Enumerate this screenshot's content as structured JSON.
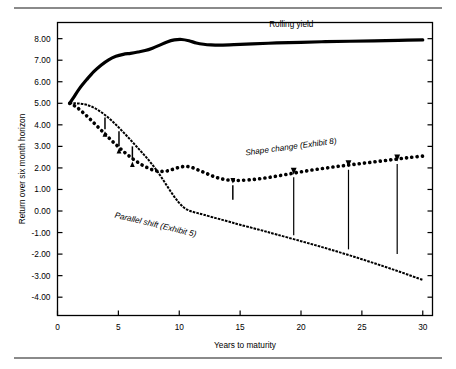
{
  "figure": {
    "background_color": "#ffffff",
    "rule_color": "#8a8a8a",
    "has_top_rule": true,
    "has_bottom_rule": true
  },
  "chart_data": {
    "type": "line",
    "title": "",
    "subtitle": "",
    "xlabel": "Years to maturity",
    "ylabel": "Return over six month horizon",
    "xlim": [
      0,
      30.8
    ],
    "ylim": [
      -4.85,
      8.75
    ],
    "grid": false,
    "legend_position": "inline-annotations",
    "xticks": [
      0,
      5,
      10,
      15,
      20,
      25,
      30
    ],
    "xtick_labels": [
      "0",
      "5",
      "10",
      "15",
      "20",
      "25",
      "30"
    ],
    "yticks": [
      8,
      7,
      6,
      5,
      4,
      3,
      2,
      1,
      0,
      -1,
      -2,
      -3,
      -4
    ],
    "ytick_labels": [
      "8.00",
      "7.00",
      "6.00",
      "5.00",
      "4.00",
      "3.00",
      "2.00",
      "1.00",
      "0.00",
      "-1.00",
      "-2.00",
      "-3.00",
      "-4.00"
    ],
    "series": [
      {
        "name": "Rolling yield",
        "style": "solid-thick",
        "color": "#000000",
        "label": "Rolling yield",
        "label_x": 19.2,
        "label_y": 8.55,
        "label_rotation": 0,
        "x": [
          1.0,
          1.3,
          1.8,
          2.4,
          3.0,
          3.6,
          4.2,
          4.8,
          5.4,
          6.0,
          6.6,
          7.2,
          7.8,
          8.4,
          9.0,
          9.6,
          10.2,
          10.8,
          11.4,
          12.0,
          12.6,
          13.4,
          14.5,
          16.0,
          18.0,
          20.0,
          22.0,
          24.0,
          26.0,
          28.0,
          30.0
        ],
        "y": [
          5.0,
          5.25,
          5.68,
          6.1,
          6.48,
          6.78,
          7.02,
          7.18,
          7.27,
          7.32,
          7.38,
          7.45,
          7.56,
          7.7,
          7.85,
          7.94,
          7.96,
          7.9,
          7.8,
          7.74,
          7.71,
          7.7,
          7.72,
          7.76,
          7.8,
          7.83,
          7.86,
          7.88,
          7.9,
          7.92,
          7.94
        ]
      },
      {
        "name": "Parallel shift (Exhibit 5)",
        "style": "dashed-fine",
        "color": "#000000",
        "label": "Parallel shift (Exhibit 5)",
        "label_x": 8.0,
        "label_y": -0.75,
        "label_rotation": 13.5,
        "x": [
          1.0,
          1.4,
          1.9,
          2.4,
          2.9,
          3.4,
          3.9,
          4.4,
          4.9,
          5.4,
          5.9,
          6.4,
          6.9,
          7.4,
          7.9,
          8.4,
          8.9,
          9.4,
          9.9,
          10.4,
          10.9,
          11.4,
          12.0,
          13.0,
          14.0,
          15.0,
          16.5,
          18.0,
          20.0,
          22.0,
          24.0,
          26.0,
          28.0,
          30.0
        ],
        "y": [
          5.0,
          5.0,
          4.98,
          4.93,
          4.82,
          4.66,
          4.46,
          4.22,
          3.95,
          3.66,
          3.36,
          3.05,
          2.74,
          2.42,
          2.07,
          1.68,
          1.25,
          0.82,
          0.44,
          0.15,
          0.0,
          -0.08,
          -0.17,
          -0.33,
          -0.48,
          -0.64,
          -0.86,
          -1.09,
          -1.4,
          -1.72,
          -2.06,
          -2.42,
          -2.8,
          -3.2
        ]
      },
      {
        "name": "Shape change (Exhibit 8)",
        "style": "dotted-heavy",
        "color": "#000000",
        "label": "Shape change (Exhibit 8)",
        "label_x": 19.2,
        "label_y": 2.86,
        "label_rotation": -7.5,
        "x": [
          1.0,
          1.5,
          2.0,
          2.5,
          3.0,
          3.5,
          4.0,
          4.5,
          5.0,
          5.5,
          6.0,
          6.5,
          7.0,
          7.5,
          8.0,
          8.5,
          9.0,
          9.5,
          10.0,
          10.5,
          11.0,
          11.5,
          12.0,
          12.5,
          13.0,
          13.5,
          14.0,
          14.5,
          15.0,
          16.0,
          17.0,
          18.0,
          19.0,
          20.0,
          21.0,
          22.0,
          23.0,
          24.0,
          25.0,
          26.0,
          27.0,
          28.0,
          29.0,
          30.0
        ],
        "y": [
          5.0,
          4.85,
          4.62,
          4.36,
          4.08,
          3.8,
          3.52,
          3.24,
          2.98,
          2.73,
          2.5,
          2.3,
          2.12,
          1.98,
          1.88,
          1.84,
          1.86,
          1.94,
          2.03,
          2.07,
          2.03,
          1.92,
          1.8,
          1.68,
          1.57,
          1.49,
          1.44,
          1.42,
          1.42,
          1.46,
          1.53,
          1.62,
          1.72,
          1.82,
          1.91,
          1.99,
          2.07,
          2.14,
          2.21,
          2.28,
          2.35,
          2.42,
          2.49,
          2.55
        ]
      }
    ],
    "annotations": [
      {
        "name": "down-arrow-1",
        "direction": "down",
        "x": 3.9,
        "y_from": 4.34,
        "y_to": 3.7
      },
      {
        "name": "down-arrow-2",
        "direction": "down",
        "x": 5.05,
        "y_from": 3.7,
        "y_to": 2.92
      },
      {
        "name": "down-arrow-3",
        "direction": "down",
        "x": 6.15,
        "y_from": 3.0,
        "y_to": 2.3
      },
      {
        "name": "up-arrow-1",
        "direction": "up",
        "x": 14.4,
        "y_from": 0.52,
        "y_to": 1.28
      },
      {
        "name": "up-arrow-2",
        "direction": "up",
        "x": 19.4,
        "y_from": -1.12,
        "y_to": 1.68
      },
      {
        "name": "up-arrow-3",
        "direction": "up",
        "x": 23.9,
        "y_from": -1.78,
        "y_to": 2.03
      },
      {
        "name": "up-arrow-4",
        "direction": "up",
        "x": 27.9,
        "y_from": -2.0,
        "y_to": 2.3
      }
    ]
  }
}
